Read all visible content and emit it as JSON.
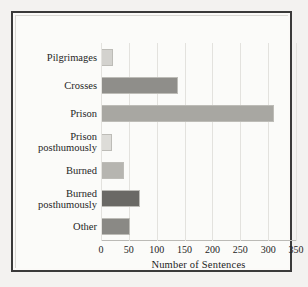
{
  "chart_data": {
    "type": "bar",
    "orientation": "horizontal",
    "title": "",
    "xlabel": "Number of Sentences",
    "ylabel": "",
    "xlim": [
      0,
      350
    ],
    "xticks": [
      0,
      50,
      100,
      150,
      200,
      250,
      300,
      350
    ],
    "xtick_labels": [
      "0",
      "50",
      "100",
      "150",
      "200",
      "250",
      "300",
      "350"
    ],
    "grid": true,
    "grid_axis": "x",
    "legend": false,
    "categories": [
      "Pilgrimages",
      "Crosses",
      "Prison",
      "Prison\nposthumously",
      "Burned",
      "Burned\nposthumously",
      "Other"
    ],
    "values": [
      20,
      137,
      308,
      18,
      40,
      69,
      50
    ],
    "bar_colors": [
      "#d3d2ce",
      "#8f8e8a",
      "#a8a7a2",
      "#dddcd8",
      "#b6b5b0",
      "#6a6965",
      "#8a8985"
    ],
    "bar_edge_color": "#bdbcb7",
    "background_color": "#fbfbf9",
    "frame_color": "#3a3a3a"
  },
  "figure": {
    "axis_title": "Number of Sentences"
  }
}
